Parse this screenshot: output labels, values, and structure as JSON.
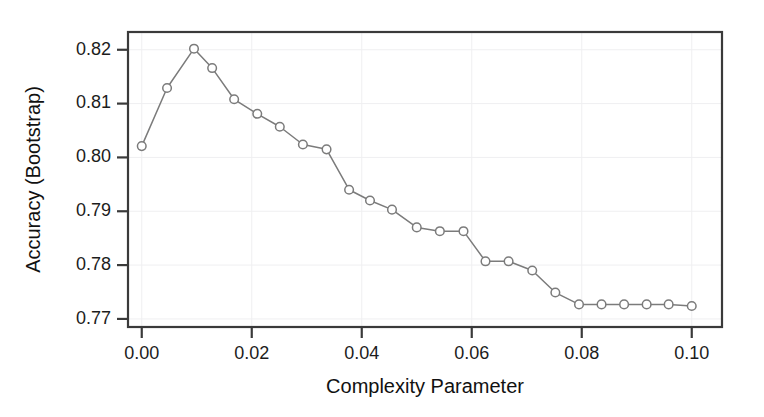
{
  "figure": {
    "width": 764,
    "height": 417,
    "background": "#ffffff",
    "line_color": "#7b7b7b",
    "axis_color": "#3a3a3a",
    "grid_color": "#efeff1",
    "text_color": "#1c1c1c"
  },
  "chart_data": {
    "type": "line",
    "title": "",
    "subtitle": "",
    "xlabel": "Complexity Parameter",
    "ylabel": "Accuracy (Bootstrap)",
    "xlim": [
      -0.0025,
      0.1055
    ],
    "ylim": [
      0.7685,
      0.8233
    ],
    "xticks": [
      0.0,
      0.02,
      0.04,
      0.06,
      0.08,
      0.1
    ],
    "xticklabels": [
      "0.00",
      "0.02",
      "0.04",
      "0.06",
      "0.08",
      "0.10"
    ],
    "yticks": [
      0.77,
      0.78,
      0.79,
      0.8,
      0.81,
      0.82
    ],
    "yticklabels": [
      "0.77",
      "0.78",
      "0.79",
      "0.80",
      "0.81",
      "0.82"
    ],
    "grid": true,
    "legend": null,
    "marker": "open-circle",
    "series": [
      {
        "name": "Accuracy (Bootstrap)",
        "x": [
          0.0,
          0.0046,
          0.0095,
          0.0128,
          0.0168,
          0.021,
          0.0251,
          0.0293,
          0.0336,
          0.0377,
          0.0415,
          0.0455,
          0.05,
          0.0542,
          0.0585,
          0.0625,
          0.0667,
          0.071,
          0.0752,
          0.0795,
          0.0836,
          0.0877,
          0.0918,
          0.0958,
          0.1
        ],
        "y": [
          0.8021,
          0.8129,
          0.8202,
          0.8166,
          0.8108,
          0.8081,
          0.8057,
          0.8024,
          0.8015,
          0.794,
          0.792,
          0.7903,
          0.787,
          0.7863,
          0.7863,
          0.7807,
          0.7807,
          0.779,
          0.7749,
          0.7727,
          0.7727,
          0.7727,
          0.7727,
          0.7727,
          0.7724
        ]
      }
    ]
  }
}
